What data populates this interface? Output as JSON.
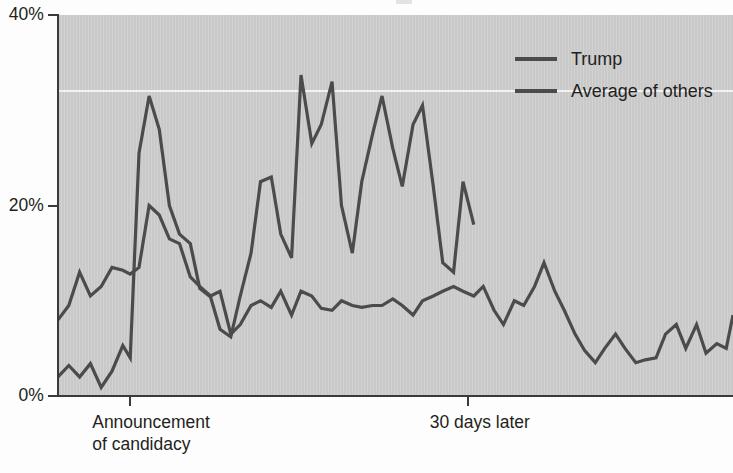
{
  "chart_data": {
    "type": "line",
    "title": "",
    "xlabel": "",
    "ylabel": "",
    "ylim": [
      0,
      40
    ],
    "grid": true,
    "gridlines": [
      32
    ],
    "legend_position": "top-right",
    "y_ticks": [
      "0%",
      "20%",
      "40%"
    ],
    "y_tick_values": [
      0,
      20,
      40
    ],
    "x_tick_labels": [
      "Announcement of candidacy",
      "30 days later"
    ],
    "x_tick_label_lines": [
      [
        "Announcement",
        "of candidacy"
      ],
      [
        "30 days later"
      ]
    ],
    "x_tick_positions": [
      10.7,
      60.7
    ],
    "x_range": [
      0,
      100
    ],
    "series": [
      {
        "name": "Trump",
        "color": "#4b4b4b",
        "x": [
          0.0,
          1.6,
          3.2,
          4.8,
          6.4,
          8.0,
          9.6,
          10.7,
          12.0,
          13.5,
          15.0,
          16.5,
          18.0,
          19.6,
          21.0,
          22.6,
          24.0,
          25.6,
          27.0,
          28.6,
          30.0,
          31.6,
          33.0,
          34.6,
          36.0,
          37.6,
          39.0,
          40.6,
          42.0,
          43.6,
          45.0,
          46.6,
          48.0,
          49.6,
          51.0,
          52.6,
          54.0,
          55.6,
          57.0,
          58.6,
          60.0,
          61.6
        ],
        "values": [
          2.0,
          3.2,
          2.0,
          3.4,
          0.9,
          2.6,
          5.3,
          4.0,
          25.5,
          31.5,
          28.0,
          20.0,
          17.0,
          16.0,
          11.3,
          10.4,
          7.0,
          6.2,
          10.5,
          15.0,
          22.5,
          23.0,
          17.0,
          14.5,
          33.7,
          26.5,
          28.5,
          33.0,
          20.0,
          15.0,
          22.5,
          27.5,
          31.5,
          26.0,
          22.0,
          28.5,
          30.5,
          22.0,
          14.0,
          13.0,
          22.5,
          18.0
        ]
      },
      {
        "name": "Average of others",
        "color": "#4b4b4b",
        "x": [
          0.0,
          1.6,
          3.2,
          4.8,
          6.4,
          8.0,
          9.6,
          10.7,
          12.0,
          13.5,
          15.0,
          16.5,
          18.0,
          19.6,
          21.0,
          22.6,
          24.0,
          25.6,
          27.0,
          28.6,
          30.0,
          31.6,
          33.0,
          34.6,
          36.0,
          37.6,
          39.0,
          40.6,
          42.0,
          43.6,
          45.0,
          46.6,
          48.0,
          49.6,
          51.0,
          52.6,
          54.0,
          55.6,
          57.0,
          58.6,
          60.0,
          61.6,
          63.0,
          64.6,
          66.0,
          67.6,
          69.0,
          70.6,
          72.0,
          73.6,
          75.0,
          76.6,
          78.0,
          79.6,
          81.0,
          82.6,
          84.0,
          85.6,
          87.0,
          88.6,
          90.0,
          91.6,
          93.0,
          94.6,
          96.0,
          97.6,
          99.0,
          100.0
        ],
        "values": [
          8.0,
          9.5,
          13.0,
          10.5,
          11.5,
          13.5,
          13.2,
          12.8,
          13.5,
          20.0,
          19.0,
          16.5,
          16.0,
          12.5,
          11.5,
          10.5,
          11.0,
          6.5,
          7.5,
          9.5,
          10.0,
          9.3,
          11.0,
          8.5,
          11.0,
          10.5,
          9.2,
          9.0,
          10.0,
          9.5,
          9.3,
          9.5,
          9.5,
          10.2,
          9.5,
          8.5,
          10.0,
          10.5,
          11.0,
          11.5,
          11.0,
          10.5,
          11.5,
          9.0,
          7.5,
          10.0,
          9.5,
          11.5,
          14.0,
          11.0,
          9.0,
          6.5,
          4.8,
          3.5,
          5.0,
          6.5,
          5.0,
          3.5,
          3.8,
          4.0,
          6.5,
          7.5,
          5.0,
          7.5,
          4.5,
          5.5,
          5.0,
          8.5
        ]
      }
    ]
  },
  "axes": {
    "y_labels": [
      {
        "text": "40%",
        "value": 40
      },
      {
        "text": "20%",
        "value": 20
      },
      {
        "text": "0%",
        "value": 0
      }
    ],
    "x_labels": [
      {
        "line1": "Announcement",
        "line2": "of candidacy",
        "value": 10.7
      },
      {
        "line1": "30 days later",
        "line2": "",
        "value": 60.7
      }
    ]
  },
  "legend": {
    "items": [
      {
        "label": "Trump",
        "color": "#4b4b4b"
      },
      {
        "label": "Average of others",
        "color": "#4b4b4b"
      }
    ]
  },
  "colors": {
    "plot_background": "#c9c9c9",
    "line": "#4b4b4b",
    "axis": "#3a3a3a",
    "gridline": "#f3f3f3",
    "text": "#231f20",
    "page_background": "#fdfdfd"
  }
}
